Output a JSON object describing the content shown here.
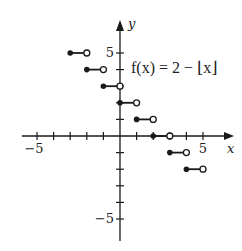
{
  "chart_data": {
    "type": "line",
    "title": "f(x) = 2 − ⌊x⌋",
    "xlabel": "x",
    "ylabel": "y",
    "xlim": [
      -6.5,
      6.5
    ],
    "ylim": [
      -7,
      7
    ],
    "grid": false,
    "x_tick_labels": [
      {
        "value": -5,
        "label": "−5"
      },
      {
        "value": 5,
        "label": "5"
      }
    ],
    "y_tick_labels": [
      {
        "value": 5,
        "label": "5"
      },
      {
        "value": -5,
        "label": "−5"
      }
    ],
    "x_ticks": [
      -5,
      -4,
      -3,
      -2,
      -1,
      1,
      2,
      3,
      4,
      5
    ],
    "y_ticks": [
      -5,
      -4,
      -3,
      -2,
      -1,
      1,
      2,
      3,
      4,
      5
    ],
    "annotation": {
      "text": "f(x) = 2 − ⌊x⌋",
      "x": 0.7,
      "y": 4
    },
    "segments": [
      {
        "x_start": -3,
        "x_end": -2,
        "y": 5,
        "closed_start": true,
        "open_end": true
      },
      {
        "x_start": -2,
        "x_end": -1,
        "y": 4,
        "closed_start": true,
        "open_end": true
      },
      {
        "x_start": -1,
        "x_end": 0,
        "y": 3,
        "closed_start": true,
        "open_end": true
      },
      {
        "x_start": 0,
        "x_end": 1,
        "y": 2,
        "closed_start": true,
        "open_end": true
      },
      {
        "x_start": 1,
        "x_end": 2,
        "y": 1,
        "closed_start": true,
        "open_end": true
      },
      {
        "x_start": 2,
        "x_end": 3,
        "y": 0,
        "closed_start": true,
        "open_end": true
      },
      {
        "x_start": 3,
        "x_end": 4,
        "y": -1,
        "closed_start": true,
        "open_end": true
      },
      {
        "x_start": 4,
        "x_end": 5,
        "y": -2,
        "closed_start": true,
        "open_end": true
      }
    ]
  },
  "colors": {
    "ink": "#1a1a1a",
    "background": "#ffffff"
  }
}
